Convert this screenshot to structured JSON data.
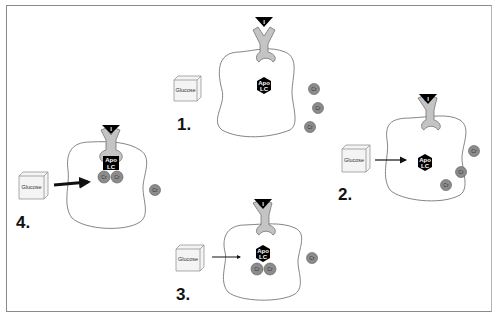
{
  "figure": {
    "colors": {
      "membrane": "#777777",
      "receptor_fill": "#c4c4c4",
      "insulin": "#000000",
      "apo_lc": "#000000",
      "cr_fill": "#8c8c8c",
      "glucose_box": "#f4f4f4"
    },
    "panels": [
      {
        "step": "1.",
        "glucose_label": "Glucose",
        "insulin_label": "I",
        "apo_label_1": "Apo",
        "apo_label_2": "LC",
        "cr_labels": [
          "Cr",
          "Cr",
          "Cr"
        ]
      },
      {
        "step": "2.",
        "glucose_label": "Glucose",
        "insulin_label": "I",
        "apo_label_1": "Apo",
        "apo_label_2": "LC",
        "cr_labels": [
          "Cr",
          "Cr",
          "Cr"
        ]
      },
      {
        "step": "3.",
        "glucose_label": "Glucose",
        "insulin_label": "I",
        "apo_label_1": "Apo",
        "apo_label_2": "LC",
        "cr_labels": [
          "Cr",
          "Cr",
          "Cr"
        ]
      },
      {
        "step": "4.",
        "glucose_label": "Glucose",
        "insulin_label": "I",
        "apo_label_1": "Apo",
        "apo_label_2": "LC",
        "cr_labels": [
          "Cr",
          "Cr",
          "Cr"
        ]
      }
    ]
  }
}
